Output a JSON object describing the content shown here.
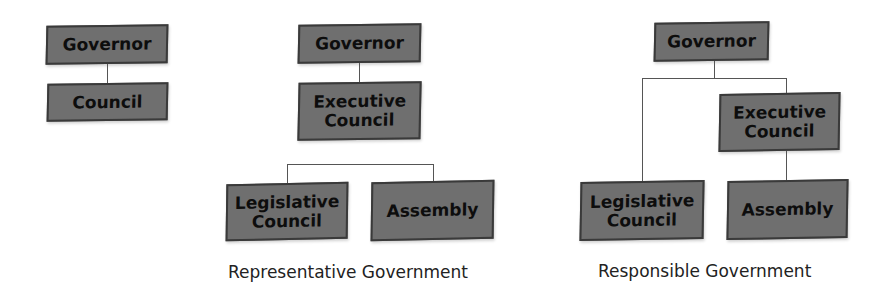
{
  "diagrams": [
    {
      "caption": "",
      "boxes": {
        "governor": "Governor",
        "council": "Council"
      }
    },
    {
      "caption": "Representative Government",
      "boxes": {
        "governor": "Governor",
        "executive_council_l1": "Executive",
        "executive_council_l2": "Council",
        "legislative_council_l1": "Legislative",
        "legislative_council_l2": "Council",
        "assembly": "Assembly"
      }
    },
    {
      "caption": "Responsible Government",
      "boxes": {
        "governor": "Governor",
        "executive_council_l1": "Executive",
        "executive_council_l2": "Council",
        "legislative_council_l1": "Legislative",
        "legislative_council_l2": "Council",
        "assembly": "Assembly"
      }
    }
  ],
  "colors": {
    "box_fill": "#6f6f6f",
    "box_border": "#3a3a3a",
    "connector": "#555555",
    "text": "#0d0d0d"
  }
}
